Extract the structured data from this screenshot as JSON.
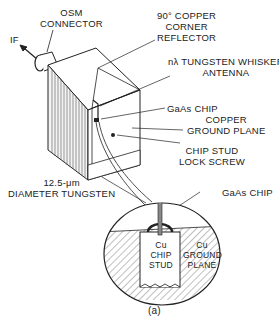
{
  "figure": {
    "caption": "(a)",
    "labels": {
      "osm_connector": [
        "OSM",
        "CONNECTOR"
      ],
      "if_output": "IF",
      "corner_reflector": [
        "90° COPPER",
        "CORNER",
        "REFLECTOR"
      ],
      "whisker_antenna": [
        "nλ TUNGSTEN WHISKER",
        "ANTENNA"
      ],
      "gaas_chip": "GaAs CHIP",
      "ground_plane": [
        "COPPER",
        "GROUND PLANE"
      ],
      "lock_screw": [
        "CHIP STUD",
        "LOCK SCREW"
      ],
      "tungsten_wire": [
        "12.5-μm",
        "DIAMETER TUNGSTEN"
      ],
      "inset_gaas_chip": "GaAs CHIP",
      "inset_chip_stud": [
        "Cu",
        "CHIP",
        "STUD"
      ],
      "inset_ground_plane": [
        "Cu",
        "GROUND",
        "PLANE"
      ]
    }
  }
}
